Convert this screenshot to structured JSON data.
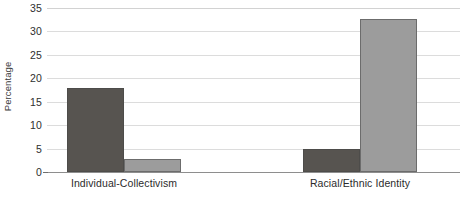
{
  "chart_data": {
    "type": "bar",
    "title": "",
    "xlabel": "",
    "ylabel": "Percentage",
    "ylim": [
      0,
      35
    ],
    "yticks": [
      0,
      5,
      10,
      15,
      20,
      25,
      30,
      35
    ],
    "ytick_labels": [
      "0",
      "5",
      "10",
      "15",
      "20",
      "25",
      "30",
      "35"
    ],
    "grid": true,
    "legend": "none",
    "categories": [
      "Individual-Collectivism",
      "Racial/Ethnic Identity"
    ],
    "series": [
      {
        "name": "series-1",
        "color": "#575450",
        "values": [
          17.9,
          4.9
        ]
      },
      {
        "name": "series-2",
        "color": "#9c9c9c",
        "values": [
          2.8,
          32.7
        ]
      }
    ]
  },
  "colors": {
    "series_dark": "#575450",
    "series_light": "#9c9c9c",
    "gridline": "#dcdcdc",
    "axis": "#8e8e8e",
    "text": "#2b2b2b",
    "background": "#ffffff"
  }
}
